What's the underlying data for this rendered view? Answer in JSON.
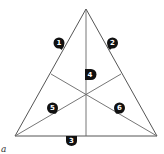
{
  "diagram": {
    "corner_label": "a",
    "vertices": [
      "apex",
      "base-left",
      "base-right"
    ],
    "regions": [
      {
        "id": 1,
        "label": "1",
        "location": "left side, upper"
      },
      {
        "id": 2,
        "label": "2",
        "location": "right side, upper"
      },
      {
        "id": 3,
        "label": "3",
        "location": "base, left of midpoint"
      },
      {
        "id": 4,
        "label": "4",
        "location": "center, upper"
      },
      {
        "id": 5,
        "label": "5",
        "location": "lower left interior"
      },
      {
        "id": 6,
        "label": "6",
        "location": "lower right interior"
      }
    ],
    "colors": {
      "line": "#555555",
      "badge": "#111111",
      "badge_text": "#ffffff"
    }
  }
}
